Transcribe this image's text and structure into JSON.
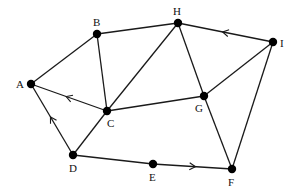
{
  "diagram": {
    "type": "graph",
    "nodes": [
      {
        "id": "A",
        "label": "A",
        "x": 31,
        "y": 84,
        "lx": 16,
        "ly": 88
      },
      {
        "id": "B",
        "label": "B",
        "x": 97,
        "y": 34,
        "lx": 93,
        "ly": 26
      },
      {
        "id": "H",
        "label": "H",
        "x": 178,
        "y": 23,
        "lx": 173,
        "ly": 15
      },
      {
        "id": "I",
        "label": "I",
        "x": 273,
        "y": 42,
        "lx": 280,
        "ly": 47
      },
      {
        "id": "C",
        "label": "C",
        "x": 107,
        "y": 111,
        "lx": 107,
        "ly": 127
      },
      {
        "id": "G",
        "label": "G",
        "x": 204,
        "y": 96,
        "lx": 195,
        "ly": 112
      },
      {
        "id": "D",
        "label": "D",
        "x": 73,
        "y": 155,
        "lx": 69,
        "ly": 172
      },
      {
        "id": "E",
        "label": "E",
        "x": 153,
        "y": 164,
        "lx": 149,
        "ly": 181
      },
      {
        "id": "F",
        "label": "F",
        "x": 232,
        "y": 169,
        "lx": 228,
        "ly": 186
      }
    ],
    "edges": [
      {
        "from": "A",
        "to": "B",
        "directed": false
      },
      {
        "from": "B",
        "to": "H",
        "directed": false
      },
      {
        "from": "I",
        "to": "H",
        "directed": true
      },
      {
        "from": "B",
        "to": "C",
        "directed": false
      },
      {
        "from": "H",
        "to": "C",
        "directed": false
      },
      {
        "from": "H",
        "to": "G",
        "directed": false
      },
      {
        "from": "I",
        "to": "G",
        "directed": false
      },
      {
        "from": "I",
        "to": "F",
        "directed": false
      },
      {
        "from": "G",
        "to": "F",
        "directed": false
      },
      {
        "from": "C",
        "to": "A",
        "directed": true
      },
      {
        "from": "C",
        "to": "G",
        "directed": false
      },
      {
        "from": "D",
        "to": "A",
        "directed": true
      },
      {
        "from": "D",
        "to": "C",
        "directed": false
      },
      {
        "from": "D",
        "to": "E",
        "directed": false
      },
      {
        "from": "E",
        "to": "F",
        "directed": true
      }
    ]
  }
}
